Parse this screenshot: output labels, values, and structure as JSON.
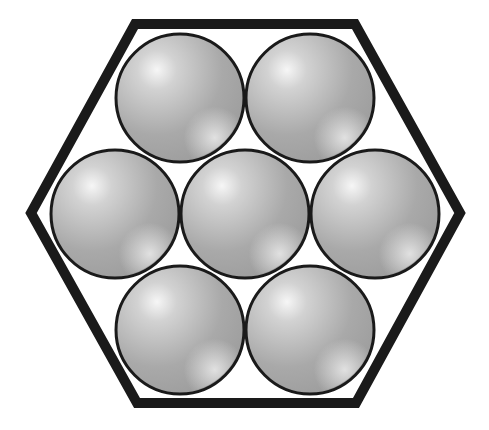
{
  "diagram": {
    "container": {
      "shape": "hexagon",
      "points": [
        [
          135,
          24
        ],
        [
          355,
          24
        ],
        [
          460,
          213
        ],
        [
          356,
          403
        ],
        [
          137,
          403
        ],
        [
          31,
          213
        ]
      ],
      "stroke": "#1a1a1a",
      "stroke_width": 10,
      "fill": "#ffffff"
    },
    "spheres": [
      {
        "id": "top-left",
        "cx": 180,
        "cy": 98,
        "r": 64
      },
      {
        "id": "top-right",
        "cx": 310,
        "cy": 98,
        "r": 64
      },
      {
        "id": "middle-left",
        "cx": 115,
        "cy": 214,
        "r": 64
      },
      {
        "id": "center",
        "cx": 245,
        "cy": 214,
        "r": 64
      },
      {
        "id": "middle-right",
        "cx": 375,
        "cy": 214,
        "r": 64
      },
      {
        "id": "bottom-left",
        "cx": 180,
        "cy": 330,
        "r": 64
      },
      {
        "id": "bottom-right",
        "cx": 310,
        "cy": 330,
        "r": 64
      }
    ],
    "sphere_style": {
      "fill_base": "#a8a8a8",
      "highlight": "#f4f4f4",
      "outline": "#1a1a1a",
      "outline_width": 3
    }
  }
}
